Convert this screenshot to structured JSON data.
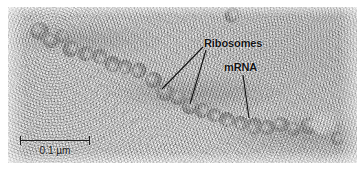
{
  "figure": {
    "type": "electron-micrograph",
    "background_color": "#d6d6d6",
    "annotation_color": "#101010"
  },
  "annotations": [
    {
      "id": "ribosomes",
      "label": "Ribosomes",
      "x": 204,
      "y": 37
    },
    {
      "id": "mrna",
      "label": "mRNA",
      "x": 224,
      "y": 61
    }
  ],
  "leader_lines": [
    {
      "from": [
        203,
        47
      ],
      "to": [
        162,
        89
      ],
      "target": "ribosome-upper"
    },
    {
      "from": [
        206,
        50
      ],
      "to": [
        190,
        104
      ],
      "target": "ribosome-lower"
    },
    {
      "from": [
        243,
        75
      ],
      "to": [
        249,
        118
      ],
      "target": "mrna-strand"
    }
  ],
  "scale_bar": {
    "label": "0.1 µm",
    "value": 0.1,
    "unit": "µm",
    "bar_left": 20,
    "bar_top": 136,
    "bar_length_px": 70,
    "color": "#1d1d1d"
  },
  "particles": {
    "count": 24,
    "list": [
      {
        "x": 30,
        "y": 22,
        "w": 19,
        "h": 18,
        "tone": "#6e6e6e"
      },
      {
        "x": 42,
        "y": 33,
        "w": 16,
        "h": 15,
        "tone": "#757575"
      },
      {
        "x": 55,
        "y": 29,
        "w": 14,
        "h": 14,
        "tone": "#7d7d7d"
      },
      {
        "x": 62,
        "y": 41,
        "w": 17,
        "h": 16,
        "tone": "#6a6a6a"
      },
      {
        "x": 78,
        "y": 46,
        "w": 16,
        "h": 15,
        "tone": "#727272"
      },
      {
        "x": 92,
        "y": 49,
        "w": 15,
        "h": 15,
        "tone": "#7a7a7a"
      },
      {
        "x": 104,
        "y": 56,
        "w": 17,
        "h": 16,
        "tone": "#6d6d6d"
      },
      {
        "x": 118,
        "y": 60,
        "w": 15,
        "h": 14,
        "tone": "#787878"
      },
      {
        "x": 131,
        "y": 63,
        "w": 16,
        "h": 15,
        "tone": "#707070"
      },
      {
        "x": 145,
        "y": 72,
        "w": 17,
        "h": 16,
        "tone": "#666666"
      },
      {
        "x": 156,
        "y": 84,
        "w": 18,
        "h": 17,
        "tone": "#6b6b6b"
      },
      {
        "x": 170,
        "y": 90,
        "w": 15,
        "h": 15,
        "tone": "#767676"
      },
      {
        "x": 181,
        "y": 98,
        "w": 17,
        "h": 16,
        "tone": "#6f6f6f"
      },
      {
        "x": 194,
        "y": 103,
        "w": 16,
        "h": 15,
        "tone": "#737373"
      },
      {
        "x": 207,
        "y": 108,
        "w": 15,
        "h": 14,
        "tone": "#7c7c7c"
      },
      {
        "x": 219,
        "y": 112,
        "w": 16,
        "h": 15,
        "tone": "#6e6e6e"
      },
      {
        "x": 233,
        "y": 116,
        "w": 15,
        "h": 14,
        "tone": "#777777"
      },
      {
        "x": 246,
        "y": 118,
        "w": 17,
        "h": 16,
        "tone": "#6a6a6a"
      },
      {
        "x": 260,
        "y": 120,
        "w": 15,
        "h": 15,
        "tone": "#757575"
      },
      {
        "x": 273,
        "y": 117,
        "w": 16,
        "h": 15,
        "tone": "#707070"
      },
      {
        "x": 286,
        "y": 122,
        "w": 15,
        "h": 14,
        "tone": "#7a7a7a"
      },
      {
        "x": 300,
        "y": 118,
        "w": 17,
        "h": 16,
        "tone": "#6c6c6c"
      },
      {
        "x": 330,
        "y": 132,
        "w": 14,
        "h": 13,
        "tone": "#747474"
      },
      {
        "x": 224,
        "y": 8,
        "w": 16,
        "h": 14,
        "tone": "#7e7e7e"
      }
    ]
  },
  "bright_blob": {
    "x": 311,
    "y": 112,
    "w": 26,
    "h": 23
  }
}
